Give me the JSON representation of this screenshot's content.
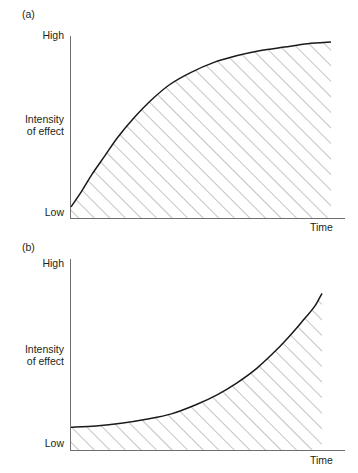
{
  "figure": {
    "background_color": "#ffffff",
    "line_color": "#1a1a1a",
    "axis_color": "#6f6f6f",
    "hatch_color": "#808080"
  },
  "panels": {
    "a": {
      "label": "(a)",
      "y_axis_top_label": "High",
      "y_axis_bottom_label": "Low",
      "y_axis_name_line1": "Intensity",
      "y_axis_name_line2": "of effect",
      "x_axis_name": "Time"
    },
    "b": {
      "label": "(b)",
      "y_axis_top_label": "High",
      "y_axis_bottom_label": "Low",
      "y_axis_name_line1": "Intensity",
      "y_axis_name_line2": "of effect",
      "x_axis_name": "Time"
    }
  },
  "chart_data": [
    {
      "id": "panel-a",
      "type": "line",
      "title": "(a)",
      "xlabel": "Time",
      "ylabel": "Intensity of effect",
      "xlim": [
        0,
        1
      ],
      "ylim": [
        0,
        1
      ],
      "xticklabels": [],
      "yticklabels": [
        "Low",
        "High"
      ],
      "grid": false,
      "legend": false,
      "shaded_under_curve": true,
      "shading_style": "diagonal-hatch-45deg-up-right",
      "series": [
        {
          "name": "saturating response",
          "description": "Rapid rise then plateau (negatively accelerated / saturating curve)",
          "x": [
            0.0,
            0.04,
            0.08,
            0.13,
            0.18,
            0.24,
            0.31,
            0.38,
            0.46,
            0.55,
            0.64,
            0.73,
            0.82,
            0.91,
            1.0
          ],
          "y": [
            0.03,
            0.12,
            0.22,
            0.33,
            0.44,
            0.55,
            0.66,
            0.75,
            0.82,
            0.88,
            0.92,
            0.95,
            0.97,
            0.99,
            1.0
          ]
        }
      ]
    },
    {
      "id": "panel-b",
      "type": "line",
      "title": "(b)",
      "xlabel": "Time",
      "ylabel": "Intensity of effect",
      "xlim": [
        0,
        1
      ],
      "ylim": [
        0,
        1
      ],
      "xticklabels": [],
      "yticklabels": [
        "Low",
        "High"
      ],
      "grid": false,
      "legend": false,
      "shaded_under_curve": true,
      "shading_style": "diagonal-hatch-45deg-up-right",
      "series": [
        {
          "name": "accelerating response",
          "description": "Flat then steeply rising (positively accelerated / exponential curve)",
          "x": [
            0.0,
            0.1,
            0.2,
            0.3,
            0.4,
            0.5,
            0.58,
            0.66,
            0.74,
            0.82,
            0.88,
            0.93,
            0.97,
            1.0
          ],
          "y": [
            0.08,
            0.09,
            0.11,
            0.14,
            0.18,
            0.25,
            0.32,
            0.41,
            0.52,
            0.66,
            0.78,
            0.89,
            0.98,
            1.08
          ]
        }
      ]
    }
  ]
}
